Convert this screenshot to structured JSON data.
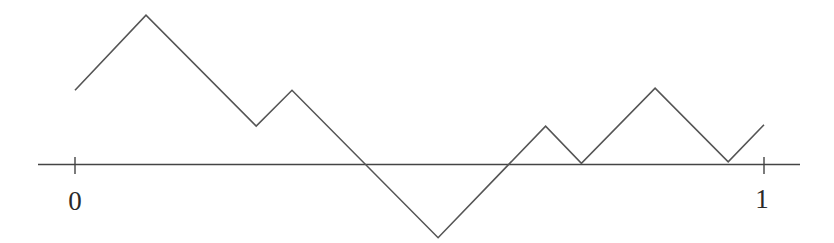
{
  "chart_data": {
    "type": "line",
    "title": "",
    "xlabel": "",
    "ylabel": "",
    "x_ticks": [
      {
        "value": 0,
        "label": "0"
      },
      {
        "value": 1,
        "label": "1"
      }
    ],
    "xlim": [
      -0.054,
      1.052
    ],
    "grid": false,
    "legend": null,
    "series": [
      {
        "name": "path",
        "color": "#555555",
        "points": [
          {
            "x": 0.0,
            "y": 0.107
          },
          {
            "x": 0.103,
            "y": 0.216
          },
          {
            "x": 0.263,
            "y": 0.055
          },
          {
            "x": 0.315,
            "y": 0.107
          },
          {
            "x": 0.527,
            "y": -0.107
          },
          {
            "x": 0.683,
            "y": 0.055
          },
          {
            "x": 0.735,
            "y": 0.001
          },
          {
            "x": 0.842,
            "y": 0.11
          },
          {
            "x": 0.948,
            "y": 0.003
          },
          {
            "x": 1.0,
            "y": 0.057
          }
        ]
      }
    ]
  },
  "axis": {
    "color": "#444444",
    "labels": {
      "zero": "0",
      "one": "1"
    }
  }
}
